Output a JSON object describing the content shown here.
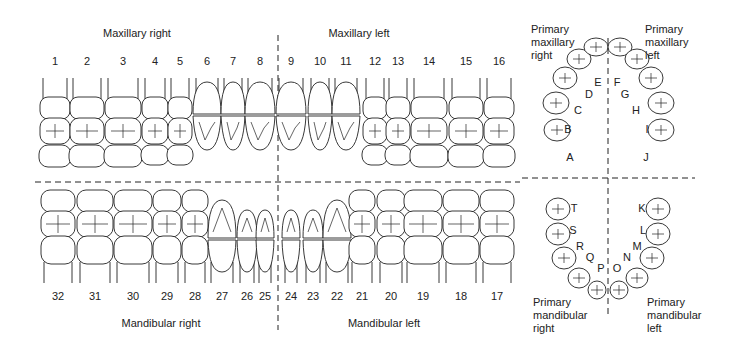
{
  "quadrants": {
    "maxillary_right": "Maxillary right",
    "maxillary_left": "Maxillary left",
    "mandibular_right": "Mandibular right",
    "mandibular_left": "Mandibular left"
  },
  "permanent_upper": [
    {
      "n": "1",
      "x": 55
    },
    {
      "n": "2",
      "x": 87
    },
    {
      "n": "3",
      "x": 123
    },
    {
      "n": "4",
      "x": 155
    },
    {
      "n": "5",
      "x": 180
    },
    {
      "n": "6",
      "x": 207
    },
    {
      "n": "7",
      "x": 233
    },
    {
      "n": "8",
      "x": 260
    },
    {
      "n": "9",
      "x": 291
    },
    {
      "n": "10",
      "x": 320
    },
    {
      "n": "11",
      "x": 346
    },
    {
      "n": "12",
      "x": 375
    },
    {
      "n": "13",
      "x": 398
    },
    {
      "n": "14",
      "x": 429
    },
    {
      "n": "15",
      "x": 466
    },
    {
      "n": "16",
      "x": 499
    }
  ],
  "permanent_lower": [
    {
      "n": "32",
      "x": 58
    },
    {
      "n": "31",
      "x": 95
    },
    {
      "n": "30",
      "x": 133
    },
    {
      "n": "29",
      "x": 167
    },
    {
      "n": "28",
      "x": 195
    },
    {
      "n": "27",
      "x": 222
    },
    {
      "n": "26",
      "x": 247
    },
    {
      "n": "25",
      "x": 265
    },
    {
      "n": "24",
      "x": 291
    },
    {
      "n": "23",
      "x": 313
    },
    {
      "n": "22",
      "x": 337
    },
    {
      "n": "21",
      "x": 362
    },
    {
      "n": "20",
      "x": 391
    },
    {
      "n": "19",
      "x": 423
    },
    {
      "n": "18",
      "x": 461
    },
    {
      "n": "17",
      "x": 497
    }
  ],
  "primary_labels": {
    "maxillary_right": [
      "Primary",
      "maxillary",
      "right"
    ],
    "maxillary_left": [
      "Primary",
      "maxillary",
      "left"
    ],
    "mandibular_right": [
      "Primary",
      "mandibular",
      "right"
    ],
    "mandibular_left": [
      "Primary",
      "mandibular",
      "left"
    ]
  },
  "primary_upper": [
    {
      "l": "A",
      "x": 570,
      "y": 157
    },
    {
      "l": "B",
      "x": 568,
      "y": 129
    },
    {
      "l": "C",
      "x": 578,
      "y": 110
    },
    {
      "l": "D",
      "x": 589,
      "y": 94
    },
    {
      "l": "E",
      "x": 598,
      "y": 82
    },
    {
      "l": "F",
      "x": 617,
      "y": 82
    },
    {
      "l": "G",
      "x": 625,
      "y": 94
    },
    {
      "l": "H",
      "x": 636,
      "y": 110
    },
    {
      "l": "I",
      "x": 647,
      "y": 129
    },
    {
      "l": "J",
      "x": 646,
      "y": 157
    }
  ],
  "primary_lower": [
    {
      "l": "T",
      "x": 574,
      "y": 208
    },
    {
      "l": "S",
      "x": 573,
      "y": 230
    },
    {
      "l": "R",
      "x": 580,
      "y": 246
    },
    {
      "l": "Q",
      "x": 590,
      "y": 257
    },
    {
      "l": "P",
      "x": 601,
      "y": 268
    },
    {
      "l": "O",
      "x": 617,
      "y": 268
    },
    {
      "l": "N",
      "x": 627,
      "y": 257
    },
    {
      "l": "M",
      "x": 637,
      "y": 246
    },
    {
      "l": "L",
      "x": 643,
      "y": 230
    },
    {
      "l": "K",
      "x": 642,
      "y": 208
    }
  ],
  "colors": {
    "line": "#222222",
    "background": "#ffffff"
  }
}
